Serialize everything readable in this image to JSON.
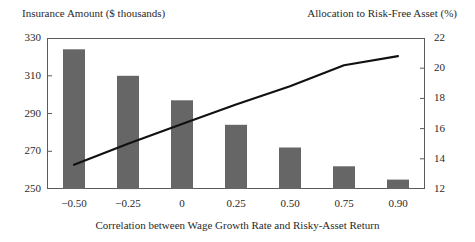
{
  "chart_data": {
    "type": "bar",
    "title": "",
    "xlabel": "Correlation between Wage Growth Rate and Risky-Asset Return",
    "categories": [
      "−0.50",
      "−0.25",
      "0",
      "0.25",
      "0.50",
      "0.75",
      "0.90"
    ],
    "grid": false,
    "legend": "none",
    "series": [
      {
        "name": "Insurance Amount ($ thousands)",
        "type": "bar",
        "axis": "left",
        "color": "#666666",
        "values": [
          324,
          310,
          297,
          284,
          272,
          262,
          255
        ]
      },
      {
        "name": "Allocation to Risk-Free Asset (%)",
        "type": "line",
        "axis": "right",
        "color": "#111111",
        "values": [
          13.6,
          15.0,
          16.3,
          17.6,
          18.8,
          20.2,
          20.8
        ]
      }
    ],
    "left_axis": {
      "label": "Insurance Amount ($ thousands)",
      "ylim": [
        250,
        330
      ],
      "ticks": [
        250,
        270,
        290,
        310,
        330
      ],
      "tick_labels": [
        "250",
        "270",
        "290",
        "310",
        "330"
      ]
    },
    "right_axis": {
      "label": "Allocation to Risk-Free Asset (%)",
      "ylim": [
        12,
        22
      ],
      "ticks": [
        12,
        14,
        16,
        18,
        20,
        22
      ],
      "tick_labels": [
        "12",
        "14",
        "16",
        "18",
        "20",
        "22"
      ]
    }
  }
}
